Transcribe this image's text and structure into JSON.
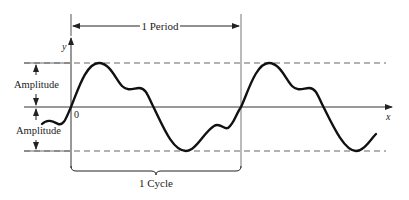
{
  "diagram": {
    "type": "waveform",
    "labels": {
      "period": "1 Period",
      "cycle": "1 Cycle",
      "amplitude_top": "Amplitude",
      "amplitude_bottom": "Amplitude",
      "y_axis": "y",
      "x_axis": "x",
      "origin": "0"
    },
    "colors": {
      "stroke": "#111111",
      "thin_line": "#555555",
      "dashed": "#666666",
      "background": "#ffffff"
    }
  }
}
